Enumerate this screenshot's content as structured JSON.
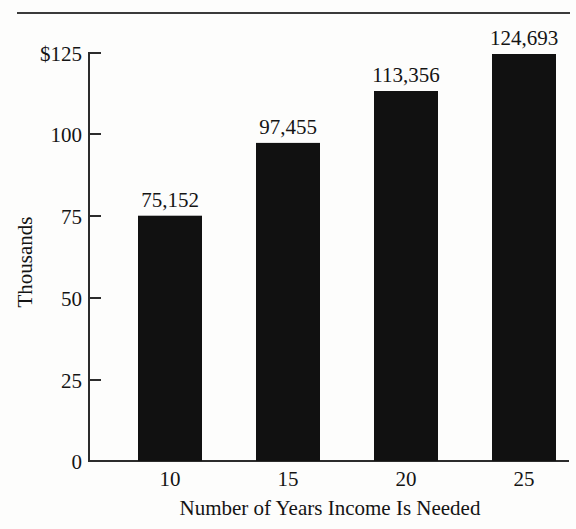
{
  "chart_data": {
    "type": "bar",
    "title": "",
    "subtitle": "",
    "xlabel": "Number of Years Income Is Needed",
    "ylabel": "Thousands",
    "categories": [
      "10",
      "15",
      "20",
      "25"
    ],
    "values": [
      75152,
      97455,
      113356,
      124693
    ],
    "data_labels": [
      "75,152",
      "97,455",
      "113,356",
      "124,693"
    ],
    "value_units": "thousands of dollars",
    "ylim": [
      0,
      125
    ],
    "y_ticks": [
      0,
      25,
      50,
      75,
      100,
      125
    ],
    "y_tick_labels": [
      "0",
      "25",
      "50",
      "75",
      "100",
      "$125"
    ],
    "x_tick_labels": [
      "10",
      "15",
      "20",
      "25"
    ],
    "grid": false,
    "legend": false,
    "legend_position": "none",
    "bar_color": "#111111",
    "axis_color": "#2c2c2c",
    "background_color": "#fdfdfc",
    "tick_direction": "inward",
    "series": [
      {
        "name": "Income needed",
        "values": [
          75152,
          97455,
          113356,
          124693
        ]
      }
    ]
  },
  "figure": {
    "top_rule_present": true
  }
}
